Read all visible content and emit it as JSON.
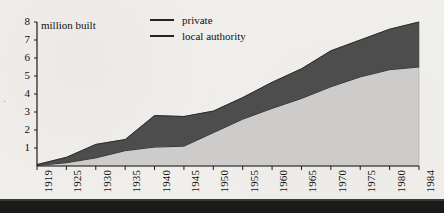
{
  "chart_data": {
    "type": "area",
    "stacked": true,
    "title": "",
    "subtitle": "",
    "xlabel": "",
    "ylabel": "million built",
    "ylim": [
      0,
      8
    ],
    "yticks": [
      1,
      2,
      3,
      4,
      5,
      6,
      7,
      8
    ],
    "ytick_labels": [
      "1",
      "2",
      "3",
      "4",
      "5",
      "6",
      "7",
      "8"
    ],
    "grid": false,
    "legend_position": "top-center",
    "x": [
      1919,
      1925,
      1930,
      1935,
      1940,
      1945,
      1950,
      1955,
      1960,
      1965,
      1970,
      1975,
      1980,
      1984
    ],
    "categories": [
      "1919",
      "1925",
      "1930",
      "1935",
      "1940",
      "1945",
      "1950",
      "1955",
      "1960",
      "1965",
      "1970",
      "1975",
      "1980",
      "1984"
    ],
    "series": [
      {
        "name": "local authority",
        "color": "#cdcccb",
        "values": [
          0.03,
          0.18,
          0.45,
          0.85,
          1.05,
          1.1,
          1.85,
          2.6,
          3.2,
          3.75,
          4.4,
          4.95,
          5.35,
          5.5
        ]
      },
      {
        "name": "private",
        "color": "#4d4d4d",
        "values": [
          0.05,
          0.3,
          0.75,
          0.62,
          1.75,
          1.65,
          1.2,
          1.2,
          1.45,
          1.65,
          2.0,
          2.05,
          2.25,
          2.5
        ]
      }
    ],
    "totals": [
      0.08,
      0.48,
      1.2,
      1.47,
      2.8,
      2.75,
      3.05,
      3.8,
      4.65,
      5.4,
      6.4,
      7.0,
      7.6,
      8.0
    ],
    "annotations": []
  },
  "legend": {
    "items": [
      {
        "label": "private",
        "color": "#222222"
      },
      {
        "label": "local authority",
        "color": "#222222"
      }
    ]
  },
  "axes": {
    "y_caption": "million built",
    "y_tick_labels": [
      "8",
      "7",
      "6",
      "5",
      "4",
      "3",
      "2",
      "1"
    ],
    "x_tick_labels": [
      "1919",
      "1925",
      "1930",
      "1935",
      "1940",
      "1945",
      "1950",
      "1955",
      "1960",
      "1965",
      "1970",
      "1975",
      "1980",
      "1984"
    ]
  },
  "page": {
    "margin_mark": "·",
    "background_color": "#f1efeb",
    "axis_color": "#1a1a1a",
    "edge_color": "#1a1a1a"
  }
}
